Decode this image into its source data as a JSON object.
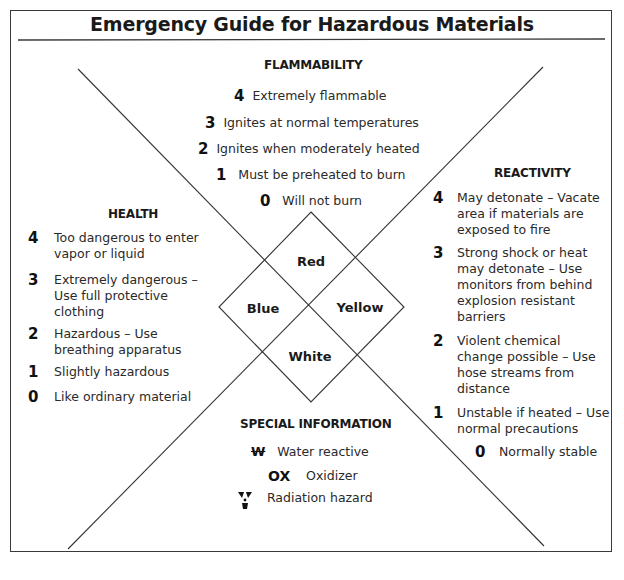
{
  "title": "Emergency Guide for Hazardous Materials",
  "flammability": {
    "heading": "FLAMMABILITY",
    "items": [
      {
        "level": "4",
        "text": "Extremely flammable"
      },
      {
        "level": "3",
        "text": "Ignites at normal temperatures"
      },
      {
        "level": "2",
        "text": "Ignites when moderately heated"
      },
      {
        "level": "1",
        "text": "Must be preheated to burn"
      },
      {
        "level": "0",
        "text": "Will not burn"
      }
    ]
  },
  "health": {
    "heading": "HEALTH",
    "items": [
      {
        "level": "4",
        "lines": [
          "Too dangerous to enter",
          "vapor or liquid"
        ]
      },
      {
        "level": "3",
        "lines": [
          "Extremely dangerous –",
          "Use full protective",
          "clothing"
        ]
      },
      {
        "level": "2",
        "lines": [
          "Hazardous – Use",
          "breathing apparatus"
        ]
      },
      {
        "level": "1",
        "lines": [
          "Slightly hazardous"
        ]
      },
      {
        "level": "0",
        "lines": [
          "Like ordinary material"
        ]
      }
    ]
  },
  "reactivity": {
    "heading": "REACTIVITY",
    "items": [
      {
        "level": "4",
        "lines": [
          "May detonate – Vacate",
          "area if materials are",
          "exposed to fire"
        ]
      },
      {
        "level": "3",
        "lines": [
          "Strong shock or heat",
          "may detonate – Use",
          "monitors from behind",
          "explosion resistant",
          "barriers"
        ]
      },
      {
        "level": "2",
        "lines": [
          "Violent chemical",
          "change possible – Use",
          "hose streams from",
          "distance"
        ]
      },
      {
        "level": "1",
        "lines": [
          "Unstable if heated – Use",
          "normal precautions"
        ]
      },
      {
        "level": "0",
        "lines": [
          "Normally stable"
        ]
      }
    ]
  },
  "diamond": {
    "top": "Red",
    "left": "Blue",
    "right": "Yellow",
    "bottom": "White"
  },
  "special": {
    "heading": "SPECIAL INFORMATION",
    "items": [
      {
        "symbol": "W̶",
        "symbol_name": "water-reactive-symbol",
        "text": "Water reactive"
      },
      {
        "symbol": "OX",
        "symbol_name": "oxidizer-symbol",
        "text": "Oxidizer"
      },
      {
        "symbol": "radiation",
        "symbol_name": "radiation-icon",
        "text": "Radiation hazard"
      }
    ]
  }
}
